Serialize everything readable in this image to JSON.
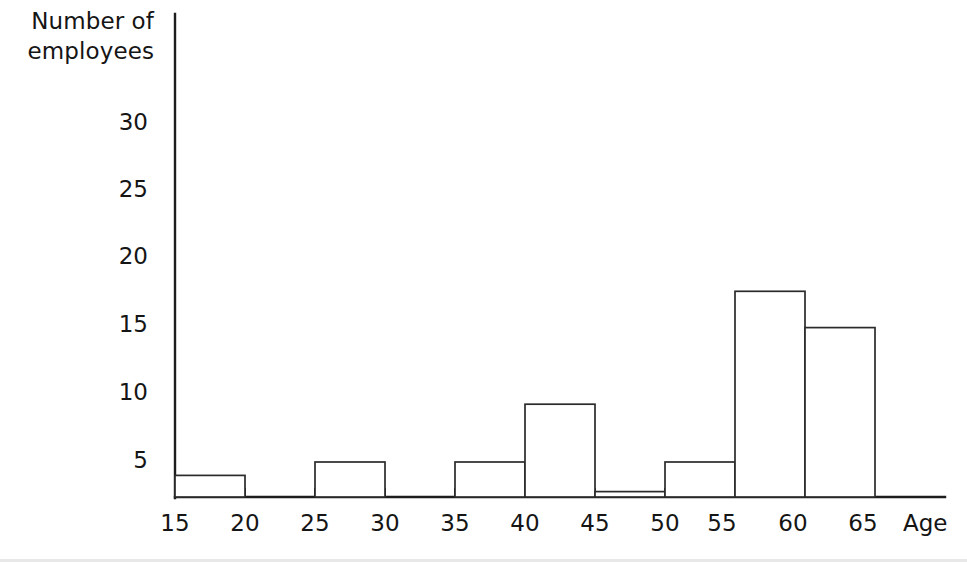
{
  "chart_data": {
    "type": "bar",
    "title": "",
    "subtitle": "",
    "xlabel": "Age",
    "ylabel": "Number of employees",
    "ylabel_lines": [
      "Number of",
      "employees"
    ],
    "grid": false,
    "legend": null,
    "note": "Histogram of employee ages in 5-year bins; vertical axis is truncated below the first printed tick.",
    "bin_width": 5,
    "xlim": [
      15,
      65
    ],
    "ylim": [
      0,
      32
    ],
    "x_tick_labels": [
      "15",
      "20",
      "25",
      "30",
      "35",
      "40",
      "45",
      "50",
      "55",
      "60",
      "65"
    ],
    "x_ticks": [
      15,
      20,
      25,
      30,
      35,
      40,
      45,
      50,
      55,
      60,
      65
    ],
    "y_tick_labels": [
      "5",
      "10",
      "15",
      "20",
      "25",
      "30"
    ],
    "y_ticks": [
      5,
      10,
      15,
      20,
      25,
      30
    ],
    "categories": [
      "15-20",
      "20-25",
      "25-30",
      "30-35",
      "35-40",
      "40-45",
      "45-50",
      "50-55",
      "55-60",
      "60-65"
    ],
    "values": [
      4,
      0,
      5,
      0,
      5,
      9.3,
      2.8,
      5,
      17.7,
      15
    ],
    "bars": [
      {
        "label": "15-20",
        "x0": 15,
        "x1": 20,
        "value": 4
      },
      {
        "label": "20-25",
        "x0": 20,
        "x1": 25,
        "value": 0
      },
      {
        "label": "25-30",
        "x0": 25,
        "x1": 30,
        "value": 5
      },
      {
        "label": "30-35",
        "x0": 30,
        "x1": 35,
        "value": 0
      },
      {
        "label": "35-40",
        "x0": 35,
        "x1": 40,
        "value": 5
      },
      {
        "label": "40-45",
        "x0": 40,
        "x1": 45,
        "value": 9.3
      },
      {
        "label": "45-50",
        "x0": 45,
        "x1": 50,
        "value": 2.8
      },
      {
        "label": "50-55",
        "x0": 50,
        "x1": 55,
        "value": 5
      },
      {
        "label": "55-60",
        "x0": 55,
        "x1": 60,
        "value": 17.7
      },
      {
        "label": "60-65",
        "x0": 60,
        "x1": 65,
        "value": 15
      }
    ],
    "colors": {
      "background": "#ffffff",
      "axis": "#1d1d1d",
      "bar_stroke": "#2b2b2b",
      "bar_fill": "#ffffff",
      "text": "#151515"
    }
  },
  "axis_labels": {
    "y_title_line1": "Number of",
    "y_title_line2": "employees",
    "x_title": "Age"
  }
}
